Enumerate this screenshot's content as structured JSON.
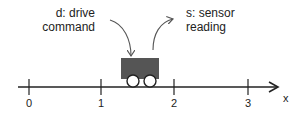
{
  "diagram": {
    "drive_label": {
      "line1": "d: drive",
      "line2": "command"
    },
    "sensor_label": {
      "line1": "s: sensor",
      "line2": "reading"
    },
    "axis": {
      "name": "x",
      "ticks": [
        {
          "label": "0",
          "x": 29
        },
        {
          "label": "1",
          "x": 101
        },
        {
          "label": "2",
          "x": 174
        },
        {
          "label": "3",
          "x": 248
        }
      ]
    },
    "cart": {
      "color": "#555555",
      "position_on_axis": "between 1 and 2"
    },
    "colors": {
      "line": "#222222",
      "cart_body": "#555555",
      "wheel_fill": "#ffffff",
      "arrow": "#555555"
    }
  }
}
